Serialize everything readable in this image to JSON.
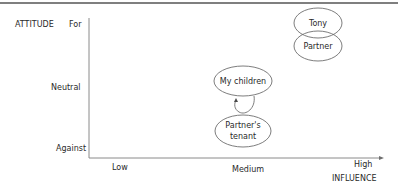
{
  "header": {
    "partial_title_cropped": "(cropped text above top rule)"
  },
  "axes": {
    "y_axis_title": "ATTITUDE",
    "y_ticks": [
      "For",
      "Neutral",
      "Against"
    ],
    "x_axis_title": "INFLUENCE",
    "x_ticks": [
      "Low",
      "Medium",
      "High"
    ]
  },
  "nodes": [
    {
      "label": "Tony",
      "influence": "High",
      "attitude": "For"
    },
    {
      "label": "Partner",
      "influence": "High",
      "attitude": "For"
    },
    {
      "label": "My children",
      "influence": "Medium",
      "attitude": "Neutral"
    },
    {
      "label_line1": "Partner's",
      "label_line2": "tenant",
      "influence": "Medium",
      "attitude": "Against"
    }
  ],
  "edges": [
    {
      "from": "Partner's tenant",
      "to": "My children",
      "style": "curved-arrow"
    }
  ],
  "colors": {
    "axis": "#8a8a8a",
    "ellipse_stroke": "#6e6e6e",
    "text": "#2a2a2a",
    "top_rule": "#555555"
  }
}
